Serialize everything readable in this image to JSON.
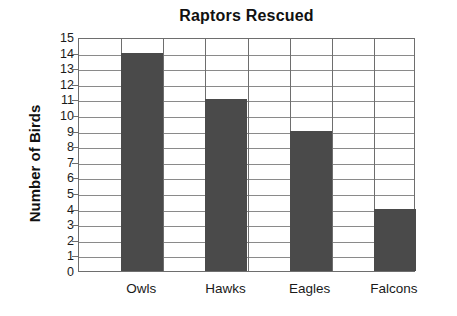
{
  "chart_data": {
    "type": "bar",
    "title": "Raptors Rescued",
    "xlabel": "",
    "ylabel": "Number of Birds",
    "categories": [
      "Owls",
      "Hawks",
      "Eagles",
      "Falcons"
    ],
    "values": [
      14,
      11,
      9,
      4
    ],
    "ylim": [
      0,
      15
    ],
    "ytick_step": 1,
    "yticks": [
      15,
      14,
      13,
      12,
      11,
      10,
      9,
      8,
      7,
      6,
      5,
      4,
      3,
      2,
      1,
      0
    ],
    "grid": true,
    "legend": null,
    "legend_position": "none",
    "colors": {
      "bar_fill": "#4a4a4a",
      "gridline": "#8a8a8a",
      "axis_line": "#6e6e6e",
      "text": "#1a1a1a",
      "background": "#ffffff"
    }
  }
}
